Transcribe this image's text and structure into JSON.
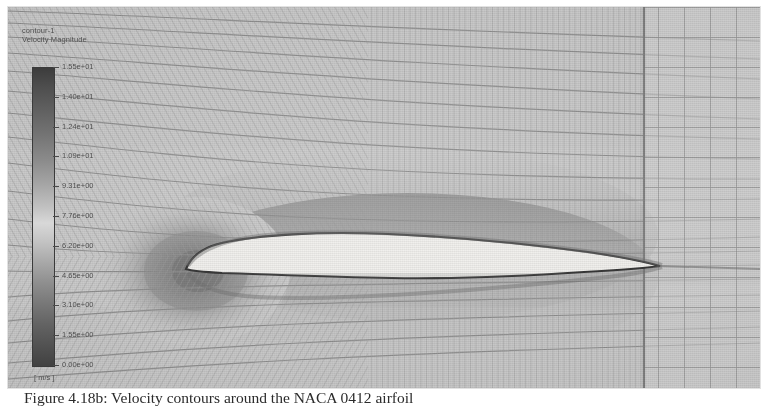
{
  "figure": {
    "type": "cfd-contour-plot",
    "software_legend": {
      "object_name": "contour-1",
      "quantity": "Velocity Magnitude",
      "units": "[ m/s ]"
    },
    "colorbar": {
      "orientation": "vertical",
      "colormap": "grayscale",
      "min": "0.00e+00",
      "max": "1.55e+01",
      "ticks": [
        "1.55e+01",
        "1.40e+01",
        "1.24e+01",
        "1.09e+01",
        "9.31e+00",
        "7.76e+00",
        "6.20e+00",
        "4.65e+00",
        "3.10e+00",
        "1.55e+00",
        "0.00e+00"
      ]
    },
    "scene": {
      "geometry": "NACA 0412 airfoil",
      "mesh": "C-grid structured mesh with downstream rectangular block",
      "background_color": "#c9c9c9",
      "airfoil_color": "#f0f0ee",
      "outline_color": "#2e2e2e"
    }
  },
  "caption": {
    "text": "Figure 4.18b: Velocity contours around the NACA 0412 airfoil"
  }
}
